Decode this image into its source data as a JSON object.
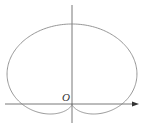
{
  "diagram": {
    "type": "polar-curve",
    "curve": "cardioid",
    "origin_label": "O",
    "colors": {
      "curve": "#8a8a8a",
      "axis": "#555555",
      "label": "#333333"
    }
  }
}
